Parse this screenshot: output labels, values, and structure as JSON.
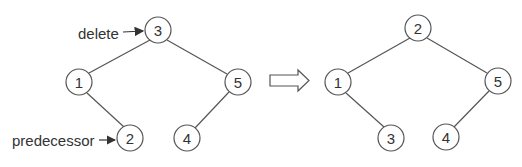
{
  "colors": {
    "stroke": "#555555",
    "text": "#333333",
    "background": "#ffffff"
  },
  "left_tree": {
    "nodes": [
      {
        "id": "l3",
        "label": "3",
        "x": 158,
        "y": 30
      },
      {
        "id": "l1",
        "label": "1",
        "x": 79,
        "y": 82
      },
      {
        "id": "l5",
        "label": "5",
        "x": 238,
        "y": 82
      },
      {
        "id": "l2",
        "label": "2",
        "x": 130,
        "y": 138
      },
      {
        "id": "l4",
        "label": "4",
        "x": 187,
        "y": 138
      }
    ],
    "annotations": {
      "delete": "delete",
      "predecessor": "predecessor"
    }
  },
  "right_tree": {
    "nodes": [
      {
        "id": "r2",
        "label": "2",
        "x": 418,
        "y": 28
      },
      {
        "id": "r1",
        "label": "1",
        "x": 338,
        "y": 82
      },
      {
        "id": "r5",
        "label": "5",
        "x": 498,
        "y": 81
      },
      {
        "id": "r3",
        "label": "3",
        "x": 391,
        "y": 138
      },
      {
        "id": "r4",
        "label": "4",
        "x": 446,
        "y": 137
      }
    ]
  },
  "transition_arrow": "hollow-right-arrow"
}
